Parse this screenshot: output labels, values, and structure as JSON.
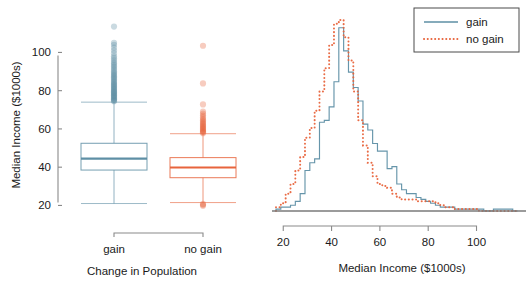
{
  "figure": {
    "title": "",
    "colors": {
      "gain": "#5e8fa5",
      "no_gain": "#e8643c",
      "axis": "#8a8a8a",
      "text": "#1a1a1a",
      "legend_border": "#4b4b4b",
      "baseline": "#7a7a7a"
    }
  },
  "left_panel": {
    "ylabel": "Median Income ($1000s)",
    "xlabel": "Change in Population",
    "y_ticks": [
      20,
      40,
      60,
      80,
      100
    ],
    "y_tick_labels": [
      "20",
      "40",
      "60",
      "80",
      "100"
    ],
    "ylim": [
      15,
      118
    ],
    "category_labels": [
      "gain",
      "no gain"
    ]
  },
  "right_panel": {
    "xlabel": "Median Income ($1000s)",
    "x_ticks": [
      20,
      40,
      60,
      80,
      100
    ],
    "x_tick_labels": [
      "20",
      "40",
      "60",
      "80",
      "100"
    ],
    "xlim": [
      17,
      118
    ],
    "legend": {
      "items": [
        {
          "label": "gain",
          "style": "solid-line",
          "color": "#5e8fa5"
        },
        {
          "label": "no gain",
          "style": "dotted-line",
          "color": "#e8643c"
        }
      ]
    }
  },
  "chart_data": [
    {
      "type": "boxplot",
      "title": "",
      "xlabel": "Change in Population",
      "ylabel": "Median Income ($1000s)",
      "ylim": [
        15,
        118
      ],
      "grid": false,
      "categories": [
        "gain",
        "no gain"
      ],
      "boxes": [
        {
          "name": "gain",
          "color": "#5e8fa5",
          "lower_whisker": 21.0,
          "q1": 38.5,
          "median": 44.5,
          "q3": 52.5,
          "upper_whisker": 74.0,
          "outliers": [
            74.5,
            74.8,
            75.2,
            75.5,
            76.0,
            76.4,
            76.8,
            77.2,
            77.6,
            78.0,
            78.4,
            78.8,
            79.2,
            79.6,
            80.0,
            80.5,
            81.0,
            81.5,
            82.0,
            82.5,
            83.0,
            83.5,
            84.0,
            84.6,
            85.2,
            85.8,
            86.4,
            87.0,
            87.6,
            88.2,
            88.8,
            89.5,
            90.2,
            91.0,
            91.8,
            92.6,
            93.4,
            94.2,
            95.0,
            96.0,
            97.0,
            98.0,
            99.5,
            101.0,
            102.5,
            104.0,
            105.0,
            113.5
          ]
        },
        {
          "name": "no gain",
          "color": "#e8643c",
          "lower_whisker": 21.5,
          "q1": 34.5,
          "median": 39.8,
          "q3": 45.0,
          "upper_whisker": 57.5,
          "outliers": [
            19.8,
            20.3,
            20.8,
            57.8,
            58.2,
            58.6,
            59.0,
            59.5,
            60.0,
            60.5,
            61.0,
            61.5,
            62.0,
            62.6,
            63.2,
            63.8,
            64.5,
            65.2,
            66.0,
            67.0,
            68.0,
            69.0,
            72.8,
            83.8,
            103.5
          ]
        }
      ]
    },
    {
      "type": "line",
      "subtype": "step-histogram",
      "title": "",
      "xlabel": "Median Income ($1000s)",
      "ylabel": "",
      "xlim": [
        17,
        118
      ],
      "ylim": [
        0,
        100
      ],
      "grid": false,
      "legend_position": "top-right",
      "bin_width": 2,
      "x": [
        18,
        20,
        22,
        24,
        26,
        28,
        30,
        32,
        34,
        36,
        38,
        40,
        42,
        44,
        46,
        48,
        50,
        52,
        54,
        56,
        58,
        60,
        62,
        64,
        66,
        68,
        70,
        72,
        74,
        76,
        78,
        80,
        82,
        84,
        86,
        88,
        90,
        92,
        94,
        96,
        98,
        100,
        102,
        104,
        106,
        108,
        110,
        112,
        114,
        116
      ],
      "series": [
        {
          "name": "gain",
          "color": "#5e8fa5",
          "style": "solid",
          "values": [
            1,
            2,
            2,
            3,
            5,
            9,
            21,
            25,
            27,
            46,
            47,
            54,
            67,
            95,
            83,
            72,
            64,
            57,
            45,
            42,
            35,
            31,
            31,
            22,
            23,
            14,
            11,
            9,
            9,
            7,
            6,
            5,
            4,
            3,
            2,
            2,
            2,
            1,
            1,
            1,
            1,
            1,
            1,
            0,
            0,
            1,
            1,
            1,
            1,
            0
          ]
        },
        {
          "name": "no gain",
          "color": "#e8643c",
          "style": "dotted",
          "values": [
            2,
            4,
            9,
            14,
            21,
            28,
            38,
            43,
            52,
            62,
            74,
            86,
            97,
            99,
            90,
            78,
            62,
            47,
            34,
            25,
            18,
            14,
            13,
            12,
            9,
            7,
            6,
            6,
            6,
            5,
            5,
            5,
            5,
            4,
            3,
            2,
            2,
            1,
            1,
            1,
            1,
            1,
            0,
            0,
            0,
            0,
            0,
            0,
            0,
            0
          ]
        }
      ]
    }
  ]
}
